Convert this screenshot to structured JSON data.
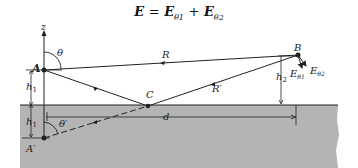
{
  "equation": {
    "lhs": "E",
    "eq": "=",
    "t1": "E",
    "t1_sub": "θ1",
    "plus": "+",
    "t2": "E",
    "t2_sub": "θ2"
  },
  "labels": {
    "z": "z",
    "theta": "θ",
    "R": "R",
    "B": "B",
    "A": "A",
    "h1_top": "h",
    "h1_top_sub": "1",
    "h1_bot": "h",
    "h1_bot_sub": "1",
    "C": "C",
    "R_prime": "R′",
    "h2": "h",
    "h2_sub": "2",
    "E1": "E",
    "E1_sub": "θ1",
    "E2": "E",
    "E2_sub": "θ2",
    "theta_prime": "θ′",
    "d": "d",
    "A_prime": "A′"
  },
  "colors": {
    "ground": "#b4b4b4",
    "line": "#222222"
  }
}
